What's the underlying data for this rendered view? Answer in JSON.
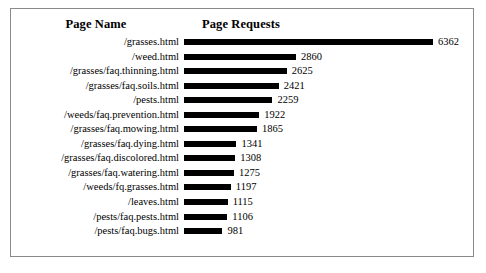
{
  "chart_data": {
    "type": "bar",
    "orientation": "horizontal",
    "title": "",
    "xlabel": "Page Requests",
    "ylabel": "Page Name",
    "headers": {
      "category": "Page Name",
      "value": "Page Requests"
    },
    "categories": [
      "/grasses.html",
      "/weed.html",
      "/grasses/faq.thinning.html",
      "/grasses/faq.soils.html",
      "/pests.html",
      "/weeds/faq.prevention.html",
      "/grasses/faq.mowing.html",
      "/grasses/faq.dying.html",
      "/grasses/faq.discolored.html",
      "/grasses/faq.watering.html",
      "/weeds/fq.grasses.html",
      "/leaves.html",
      "/pests/faq.pests.html",
      "/pests/faq.bugs.html"
    ],
    "values": [
      6362,
      2860,
      2625,
      2421,
      2259,
      1922,
      1865,
      1341,
      1308,
      1275,
      1197,
      1115,
      1106,
      981
    ],
    "xlim": [
      0,
      6362
    ],
    "grid": false,
    "legend": false,
    "bar_color": "#000000",
    "data_labels": true
  },
  "style": {
    "border_color": "#8a8a8a",
    "background": "#ffffff",
    "text_color": "#000000"
  }
}
